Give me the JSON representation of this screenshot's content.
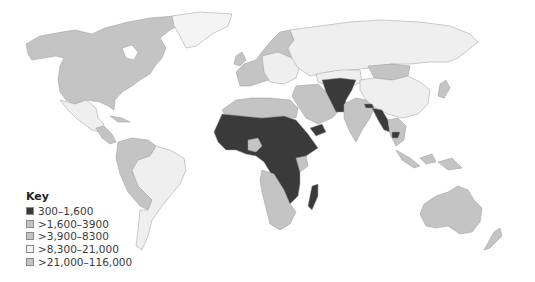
{
  "map": {
    "title": "",
    "subject": "World map shaded by category value",
    "legend": {
      "title": "Key",
      "items": [
        {
          "label": "300–1,600",
          "color": "#3a3a3a"
        },
        {
          "label": ">1,600–3900",
          "color": "#c4c4c4"
        },
        {
          "label": ">3,900–8300",
          "color": "#c4c4c4"
        },
        {
          "label": ">8,300–21,000",
          "color": "#f2f2f2"
        },
        {
          "label": ">21,000–116,000",
          "color": "#c4c4c4"
        }
      ]
    },
    "colors": {
      "dark": "#3a3a3a",
      "mid": "#c4c4c4",
      "light": "#efefef",
      "ocean": "#ffffff",
      "border": "#9a9a9a"
    },
    "regions": {
      "sub_saharan_africa": "300–1,600",
      "afghanistan_pakistan_region": "300–1,600",
      "myanmar_bangladesh_region": "300–1,600",
      "north_america": "mid",
      "south_america_west": "mid",
      "brazil_argentina": "light",
      "russia_china": "light",
      "india_middle_east": "mid",
      "australia": "mid",
      "southern_africa": "mid"
    }
  }
}
